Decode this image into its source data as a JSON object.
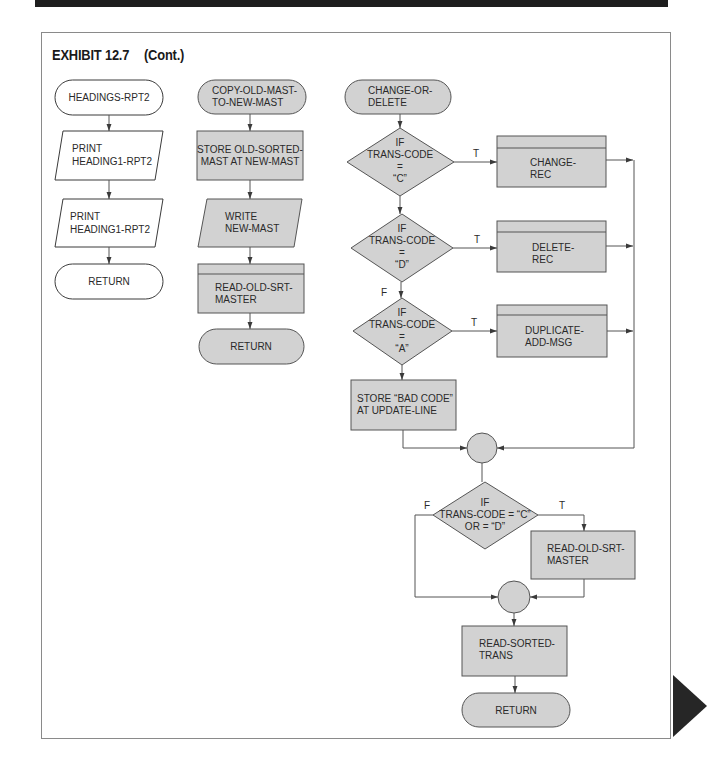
{
  "exhibit": {
    "title": "EXHIBIT 12.7",
    "subtitle": "(Cont.)"
  },
  "colors": {
    "header_bar": "#1e1e1e",
    "shape_fill_gray": "#d2d2d2",
    "shape_fill_white": "#ffffff",
    "line": "#555555",
    "next_page_marker": "#262626"
  },
  "columns": [
    {
      "name": "headings-rpt2",
      "nodes": [
        {
          "type": "terminal",
          "fill": "white",
          "lines": [
            "HEADINGS-RPT2"
          ]
        },
        {
          "type": "io",
          "fill": "white",
          "lines": [
            "PRINT",
            "HEADING1-RPT2"
          ]
        },
        {
          "type": "io",
          "fill": "white",
          "lines": [
            "PRINT",
            "HEADING1-RPT2"
          ]
        },
        {
          "type": "terminal",
          "fill": "white",
          "lines": [
            "RETURN"
          ]
        }
      ]
    },
    {
      "name": "copy-old-mast-to-new-mast",
      "nodes": [
        {
          "type": "terminal",
          "fill": "gray",
          "lines": [
            "COPY-OLD-MAST-",
            "TO-NEW-MAST"
          ]
        },
        {
          "type": "process",
          "fill": "gray",
          "lines": [
            "STORE OLD-SORTED-",
            "MAST AT NEW-MAST"
          ]
        },
        {
          "type": "io",
          "fill": "gray",
          "lines": [
            "WRITE",
            "NEW-MAST"
          ]
        },
        {
          "type": "predefined",
          "fill": "gray",
          "lines": [
            "READ-OLD-SRT-",
            "MASTER"
          ]
        },
        {
          "type": "terminal",
          "fill": "gray",
          "lines": [
            "RETURN"
          ]
        }
      ]
    },
    {
      "name": "change-or-delete",
      "nodes": [
        {
          "type": "terminal",
          "fill": "gray",
          "lines": [
            "CHANGE-OR-",
            "DELETE"
          ]
        },
        {
          "type": "decision",
          "fill": "gray",
          "lines": [
            "IF",
            "TRANS-CODE",
            "=",
            "“C”"
          ],
          "true_label": "T"
        },
        {
          "type": "predefined",
          "fill": "gray",
          "lines": [
            "CHANGE-",
            "REC"
          ]
        },
        {
          "type": "decision",
          "fill": "gray",
          "lines": [
            "IF",
            "TRANS-CODE",
            "=",
            "“D”"
          ],
          "true_label": "T",
          "false_label": "F"
        },
        {
          "type": "predefined",
          "fill": "gray",
          "lines": [
            "DELETE-",
            "REC"
          ]
        },
        {
          "type": "decision",
          "fill": "gray",
          "lines": [
            "IF",
            "TRANS-CODE",
            "=",
            "“A”"
          ],
          "true_label": "T"
        },
        {
          "type": "predefined",
          "fill": "gray",
          "lines": [
            "DUPLICATE-",
            "ADD-MSG"
          ]
        },
        {
          "type": "process",
          "fill": "gray",
          "lines": [
            "STORE “BAD CODE”",
            "AT UPDATE-LINE"
          ]
        },
        {
          "type": "connector",
          "fill": "gray",
          "lines": []
        },
        {
          "type": "decision",
          "fill": "gray",
          "lines": [
            "IF",
            "TRANS-CODE = “C”",
            "OR = “D”"
          ],
          "true_label": "T",
          "false_label": "F"
        },
        {
          "type": "process",
          "fill": "gray",
          "lines": [
            "READ-OLD-SRT-",
            "MASTER"
          ]
        },
        {
          "type": "connector",
          "fill": "gray",
          "lines": []
        },
        {
          "type": "process",
          "fill": "gray",
          "lines": [
            "READ-SORTED-",
            "TRANS"
          ]
        },
        {
          "type": "terminal",
          "fill": "gray",
          "lines": [
            "RETURN"
          ]
        }
      ]
    }
  ]
}
